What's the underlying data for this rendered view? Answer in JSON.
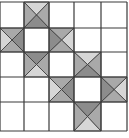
{
  "diagram": {
    "canvas": {
      "width": 129,
      "height": 138
    },
    "grid": {
      "cols_x": [
        0,
        24,
        49,
        74,
        101,
        127
      ],
      "rows_y": [
        2,
        28,
        52,
        77,
        102,
        131
      ],
      "line_color": "#3a3a3a"
    },
    "colors": {
      "background": "#ffffff",
      "dark": "#8c8c8c",
      "medium": "#a9a9a9",
      "light": "#d6d6d6",
      "white": "#f4f4f4"
    },
    "blocks": [
      {
        "name": "star-block-1",
        "center": [
          1,
          1
        ]
      },
      {
        "name": "star-block-2",
        "center": [
          3,
          3
        ]
      }
    ],
    "extra_lines": [
      {
        "x1": 0,
        "y1": 131,
        "x2": 74,
        "y2": 131
      },
      {
        "x1": 101,
        "y1": 2,
        "x2": 101,
        "y2": 131
      }
    ]
  }
}
